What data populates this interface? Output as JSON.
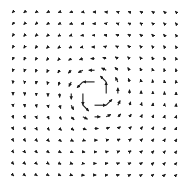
{
  "chart_data": {
    "type": "quiver",
    "title": "",
    "xlabel": "",
    "ylabel": "",
    "grid": false,
    "legend": null,
    "grid_size": [
      15,
      15
    ],
    "x_range": [
      -7,
      7
    ],
    "y_range": [
      -7,
      7
    ],
    "field": {
      "u": "-y / r^2",
      "v": "x / r^2"
    },
    "center": [
      0,
      0
    ],
    "arrow_color": "#1a1a1a",
    "background": "#ffffff",
    "layout": {
      "origin_px": [
        13,
        12
      ],
      "spacing_px": 11.65,
      "scale_px_per_unit": 11.6
    }
  }
}
